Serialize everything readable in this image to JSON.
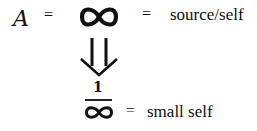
{
  "equation_top": {
    "variable": "A",
    "equals_1": "=",
    "symbol": "∞",
    "equals_2": "=",
    "label": "source/self"
  },
  "transition": {
    "arrow": "double-down-arrow"
  },
  "equation_bottom": {
    "numerator": "1",
    "denominator_symbol": "∞",
    "equals": "=",
    "label": "small self"
  }
}
